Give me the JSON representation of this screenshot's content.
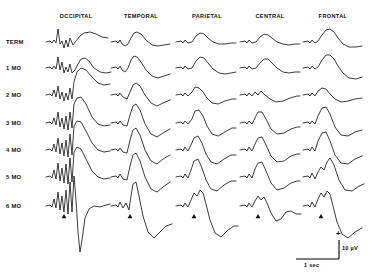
{
  "figure": {
    "columns": [
      {
        "label": "OCCIPITAL",
        "x": 76
      },
      {
        "label": "TEMPORAL",
        "x": 141
      },
      {
        "label": "PARIETAL",
        "x": 207
      },
      {
        "label": "CENTRAL",
        "x": 270
      },
      {
        "label": "FRONTAL",
        "x": 333
      }
    ],
    "rows": [
      {
        "label": "TERM",
        "y": 42
      },
      {
        "label": "1 MO",
        "y": 68
      },
      {
        "label": "2 MO",
        "y": 95
      },
      {
        "label": "3 MO",
        "y": 123
      },
      {
        "label": "4 MO",
        "y": 150
      },
      {
        "label": "5 MO",
        "y": 177
      },
      {
        "label": "6 MO",
        "y": 206
      }
    ],
    "row_label_x": 6,
    "scale_bar": {
      "plus_sign": "+",
      "amplitude_label": "10 µV",
      "time_label": "1 sec"
    }
  },
  "chart_data": {
    "type": "line",
    "title": "",
    "xlabel": "",
    "ylabel": "",
    "categories": [
      "OCCIPITAL",
      "TEMPORAL",
      "PARIETAL",
      "CENTRAL",
      "FRONTAL"
    ],
    "series": [
      {
        "name": "TERM",
        "values": [
          1,
          1,
          1,
          1,
          1
        ]
      },
      {
        "name": "1 MO",
        "values": [
          1,
          1,
          1,
          1,
          1
        ]
      },
      {
        "name": "2 MO",
        "values": [
          1,
          1,
          1,
          1,
          1
        ]
      },
      {
        "name": "3 MO",
        "values": [
          1,
          1,
          1,
          1,
          1
        ]
      },
      {
        "name": "4 MO",
        "values": [
          1,
          1,
          1,
          1,
          1
        ]
      },
      {
        "name": "5 MO",
        "values": [
          1,
          1,
          1,
          1,
          1
        ]
      },
      {
        "name": "6 MO",
        "values": [
          1,
          1,
          1,
          1,
          1
        ]
      }
    ],
    "legend_position": "none",
    "grid": false,
    "calibration": {
      "time": "1 sec",
      "amplitude": "10 µV",
      "polarity": "+"
    },
    "traces": [
      {
        "row": "TERM",
        "paths": [
          "M 46 42 L 50 41 L 52 43 L 54 40 L 56 43 L 58 29 L 60 44 L 62 41 L 64 48 L 66 40 L 68 47 L 70 38 L 73 45 L 76 41 L 80 36 L 84 33 L 90 32 L 96 34 L 102 37 L 108 38",
          "M 111 42 L 116 41 L 118 43 L 120 40 L 122 44 L 125 46 L 128 44 L 131 38 L 134 33 L 137 32 L 141 34 L 146 40 L 152 45 L 158 46 L 164 45 L 170 44",
          "M 176 42 L 181 41 L 183 43 L 185 40 L 188 43 L 192 42 L 196 36 L 200 33 L 204 34 L 208 38 L 213 42 L 219 44 L 225 44 L 231 43 L 236 43",
          "M 240 42 L 245 41 L 247 43 L 249 40 L 252 43 L 256 42 L 260 37 L 264 34 L 268 35 L 272 38 L 277 42 L 283 44 L 289 45 L 295 44 L 300 44",
          "M 303 42 L 308 41 L 310 43 L 312 40 L 315 43 L 318 41 L 322 35 L 326 30 L 330 29 L 334 32 L 338 38 L 343 44 L 349 47 L 356 47 L 362 46"
        ]
      },
      {
        "row": "1 MO",
        "paths": [
          "M 46 68 L 50 67 L 52 69 L 54 66 L 56 69 L 58 57 L 60 70 L 62 62 L 64 73 L 66 67 L 68 72 L 70 64 L 72 73 L 75 70 L 78 64 L 81 59 L 85 58 L 89 61 L 94 68 L 100 72 L 106 73 L 111 72",
          "M 111 68 L 116 67 L 118 69 L 120 66 L 122 70 L 125 72 L 128 68 L 131 60 L 134 56 L 137 57 L 141 62 L 146 70 L 152 76 L 158 78 L 164 76 L 170 74",
          "M 176 68 L 181 67 L 183 69 L 185 66 L 188 69 L 192 68 L 196 61 L 200 57 L 204 58 L 208 63 L 213 69 L 219 73 L 225 74 L 231 73 L 236 72",
          "M 240 68 L 245 67 L 247 69 L 249 66 L 252 69 L 256 68 L 260 63 L 264 59 L 268 59 L 272 63 L 277 68 L 283 72 L 289 73 L 295 72 L 300 72",
          "M 303 68 L 308 67 L 310 69 L 312 66 L 315 69 L 318 67 L 322 60 L 326 55 L 330 55 L 334 59 L 338 66 L 343 73 L 349 78 L 356 79 L 362 77"
        ]
      },
      {
        "row": "2 MO",
        "paths": [
          "M 46 95 L 50 94 L 52 96 L 54 90 L 56 97 L 58 86 L 60 99 L 62 92 L 64 101 L 66 93 L 68 100 L 70 88 L 72 99 L 74 82 L 77 72 L 81 68 L 86 70 L 92 77 L 98 83 L 104 85 L 110 84",
          "M 111 95 L 116 94 L 118 96 L 120 93 L 123 97 L 127 99 L 130 92 L 133 85 L 136 83 L 140 86 L 145 95 L 151 103 L 157 106 L 163 103 L 170 100",
          "M 176 95 L 181 94 L 183 96 L 185 93 L 188 96 L 192 92 L 195 87 L 199 88 L 203 92 L 207 98 L 212 103 L 218 104 L 225 101 L 232 99 L 236 99",
          "M 240 95 L 245 94 L 247 96 L 249 93 L 252 96 L 255 92 L 258 95 L 261 91 L 265 95 L 270 99 L 276 102 L 283 101 L 290 98 L 297 96 L 300 96",
          "M 303 95 L 308 94 L 310 96 L 312 93 L 315 96 L 318 91 L 322 88 L 326 89 L 330 94 L 335 99 L 341 102 L 348 101 L 355 99 L 362 98"
        ]
      },
      {
        "row": "3 MO",
        "paths": [
          "M 46 123 L 50 122 L 52 124 L 54 118 L 56 125 L 58 112 L 60 127 L 62 118 L 64 129 L 66 116 L 68 130 L 70 112 L 72 128 L 74 104 L 77 98 L 81 97 L 86 104 L 92 117 L 98 124 L 104 126 L 110 125",
          "M 111 123 L 116 122 L 118 124 L 120 121 L 123 125 L 127 126 L 130 115 L 133 106 L 136 104 L 140 110 L 145 124 L 151 134 L 157 137 L 163 133 L 170 129",
          "M 176 123 L 181 122 L 183 124 L 185 121 L 188 124 L 192 119 L 195 111 L 199 110 L 203 116 L 207 126 L 212 134 L 218 136 L 225 132 L 232 128 L 236 128",
          "M 240 123 L 245 122 L 247 124 L 249 121 L 252 124 L 255 118 L 258 112 L 262 112 L 266 119 L 271 129 L 277 134 L 284 133 L 291 129 L 297 127 L 300 127",
          "M 303 123 L 308 122 L 310 124 L 312 121 L 315 124 L 318 116 L 322 108 L 326 107 L 330 114 L 335 127 L 341 135 L 348 136 L 355 132 L 362 130"
        ]
      },
      {
        "row": "4 MO",
        "paths": [
          "M 46 150 L 50 149 L 52 151 L 54 144 L 56 152 L 58 138 L 60 154 L 62 143 L 64 156 L 66 140 L 68 157 L 70 134 L 72 155 L 74 126 L 77 121 L 81 122 L 86 131 L 92 143 L 98 150 L 104 152 L 110 151",
          "M 111 150 L 116 149 L 118 151 L 120 148 L 123 152 L 127 153 L 130 140 L 133 130 L 136 128 L 140 135 L 145 150 L 151 161 L 157 164 L 163 159 L 170 155",
          "M 176 150 L 181 149 L 183 151 L 185 147 L 188 151 L 191 145 L 194 138 L 198 136 L 202 143 L 206 154 L 211 162 L 217 164 L 224 159 L 231 155 L 236 155",
          "M 240 150 L 245 149 L 247 151 L 249 147 L 252 151 L 255 144 L 258 138 L 262 137 L 266 145 L 271 156 L 277 162 L 284 161 L 291 156 L 297 154 L 300 154",
          "M 303 150 L 308 149 L 310 151 L 312 147 L 315 151 L 318 141 L 322 133 L 326 132 L 330 141 L 335 155 L 341 163 L 348 164 L 355 159 L 362 156"
        ]
      },
      {
        "row": "5 MO",
        "paths": [
          "M 46 177 L 50 176 L 52 178 L 54 170 L 56 179 L 58 163 L 60 181 L 62 168 L 64 183 L 66 164 L 68 184 L 70 158 L 72 182 L 74 152 L 77 147 L 81 149 L 86 159 L 92 171 L 98 177 L 104 179 L 110 178",
          "M 111 177 L 116 176 L 118 178 L 120 174 L 123 179 L 127 180 L 130 166 L 133 155 L 136 153 L 140 161 L 145 177 L 151 189 L 157 192 L 163 187 L 170 182",
          "M 176 177 L 181 176 L 183 178 L 185 174 L 188 178 L 191 170 L 194 161 L 198 159 L 202 168 L 206 180 L 211 189 L 217 191 L 224 185 L 231 181 L 236 181",
          "M 240 177 L 245 176 L 247 178 L 249 174 L 252 178 L 255 169 L 258 163 L 262 162 L 266 171 L 271 183 L 277 190 L 284 188 L 291 183 L 297 181 L 300 181",
          "M 303 177 L 308 176 L 310 178 L 312 173 L 315 179 L 318 172 L 321 167 L 324 170 L 327 162 L 330 158 L 334 165 L 339 180 L 345 190 L 352 191 L 359 186 L 364 184"
        ]
      },
      {
        "row": "6 MO",
        "paths": [
          "M 46 206 L 50 205 L 52 207 L 54 199 L 56 208 L 58 192 L 60 210 L 62 196 L 64 212 L 66 190 L 68 214 L 70 182 L 72 212 L 74 176 L 76 200 L 78 232 L 80 252 L 82 240 L 85 218 L 89 209 L 94 206 L 100 207 L 106 205 L 110 204",
          "M 111 206 L 116 205 L 118 207 L 120 202 L 123 208 L 126 203 L 129 210 L 131 196 L 133 184 L 136 182 L 139 196 L 143 216 L 148 232 L 154 238 L 160 232 L 166 226 L 172 224",
          "M 176 206 L 181 205 L 183 207 L 185 203 L 188 207 L 191 200 L 194 193 L 197 196 L 200 190 L 203 193 L 206 204 L 210 220 L 215 233 L 221 237 L 228 230 L 234 226 L 238 226",
          "M 240 206 L 245 205 L 247 207 L 249 203 L 252 207 L 255 201 L 258 196 L 261 200 L 264 197 L 267 203 L 271 213 L 276 221 L 281 219 L 286 212 L 291 211 L 296 214 L 301 214",
          "M 303 206 L 308 205 L 310 207 L 312 202 L 315 207 L 318 199 L 321 193 L 324 197 L 327 191 L 330 194 L 333 206 L 337 222 L 342 234 L 348 238 L 355 232 L 362 228"
        ]
      }
    ],
    "stimulus_markers": [
      {
        "x": 64,
        "y": 214
      },
      {
        "x": 130,
        "y": 214
      },
      {
        "x": 194,
        "y": 214
      },
      {
        "x": 258,
        "y": 214
      },
      {
        "x": 321,
        "y": 214
      }
    ]
  }
}
